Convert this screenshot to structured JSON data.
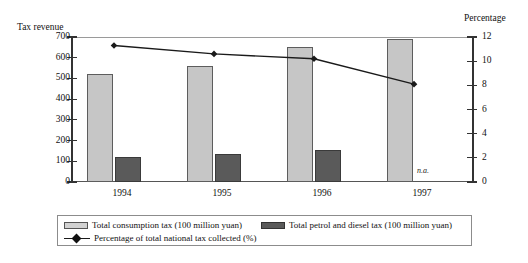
{
  "chart_data": {
    "type": "bar",
    "title": "",
    "categories": [
      "1994",
      "1995",
      "1996",
      "1997"
    ],
    "xlabel": "",
    "ylabel": "Tax revenue",
    "y2label": "Percentage",
    "ylim": [
      0,
      700
    ],
    "y2lim": [
      0,
      12
    ],
    "yticks": [
      "700",
      "600",
      "500",
      "400",
      "300",
      "200",
      "100",
      "0"
    ],
    "y2ticks": [
      "12",
      "10",
      "8",
      "6",
      "4",
      "2",
      "0"
    ],
    "grid": false,
    "legend_position": "bottom",
    "series": [
      {
        "name": "Total consumption tax (100 million yuan)",
        "type": "bar",
        "axis": "left",
        "color": "#c6c6c6",
        "values": [
          520,
          560,
          650,
          690
        ]
      },
      {
        "name": "Total petrol and diesel tax (100 million yuan)",
        "type": "bar",
        "axis": "left",
        "color": "#5a5a5a",
        "values": [
          120,
          133,
          155,
          null
        ],
        "missing_label": "n.a."
      },
      {
        "name": "Percentage of total national tax collected (%)",
        "type": "line",
        "axis": "right",
        "color": "#1a1a1a",
        "values": [
          11.3,
          10.6,
          10.2,
          8.1
        ]
      }
    ]
  },
  "legend": {
    "item_consumption_tax": "Total consumption tax (100 million yuan)",
    "item_petrol_diesel_tax": "Total petrol and diesel tax (100 million yuan)",
    "item_percentage_line": "Percentage of total national tax collected (%)"
  },
  "annotations": {
    "na_1997": "n.a."
  }
}
